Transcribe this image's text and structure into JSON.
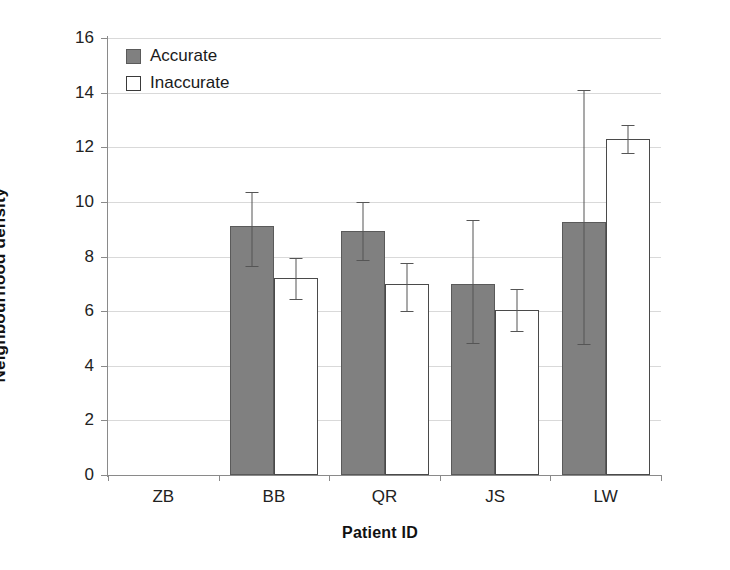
{
  "chart_data": {
    "type": "bar",
    "title": "",
    "xlabel": "Patient ID",
    "ylabel": "Neighbourhood density",
    "categories": [
      "ZB",
      "BB",
      "QR",
      "JS",
      "LW"
    ],
    "ylim": [
      0,
      16
    ],
    "yticks": [
      0,
      2,
      4,
      6,
      8,
      10,
      12,
      14,
      16
    ],
    "ytick_labels": [
      "0",
      "2",
      "4",
      "6",
      "8",
      "10",
      "12",
      "14",
      "16"
    ],
    "grid": true,
    "grid_axis": "y",
    "legend_position": "upper-left-inside",
    "error_bars": "present",
    "notes_missing": "ZB has no data plotted",
    "series": [
      {
        "name": "Accurate",
        "color": "#808080",
        "values": [
          null,
          9.1,
          8.95,
          7.0,
          9.25
        ],
        "err_upper": [
          null,
          10.35,
          10.0,
          9.35,
          14.1
        ],
        "err_lower": [
          null,
          7.6,
          7.85,
          4.8,
          4.75
        ]
      },
      {
        "name": "Inaccurate",
        "color": "#ffffff",
        "values": [
          null,
          7.2,
          7.0,
          6.05,
          12.3
        ],
        "err_upper": [
          null,
          7.95,
          7.75,
          6.8,
          12.8
        ],
        "err_lower": [
          null,
          6.4,
          5.95,
          5.25,
          11.75
        ]
      }
    ]
  },
  "legend": {
    "items": [
      {
        "label": "Accurate",
        "swatch": "filled-gray-square"
      },
      {
        "label": "Inaccurate",
        "swatch": "open-white-square"
      }
    ]
  },
  "colors": {
    "accurate_fill": "#808080",
    "inaccurate_fill": "#ffffff",
    "bar_stroke": "#4a4a4a",
    "gridline": "#d9d9d9",
    "axis": "#8a8a8a",
    "text": "#1a1a1a"
  }
}
